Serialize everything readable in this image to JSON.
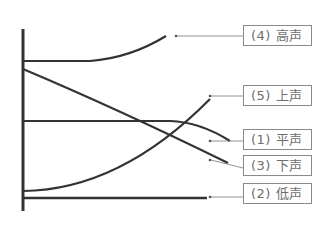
{
  "diagram": {
    "type": "tone-contour-diagram",
    "line_color": "#333333",
    "leader_color": "#777777",
    "labels": [
      {
        "id": "4",
        "text": "(4) 高声",
        "top": 25
      },
      {
        "id": "5",
        "text": "(5) 上声",
        "top": 85
      },
      {
        "id": "1",
        "text": "(1) 平声",
        "top": 129
      },
      {
        "id": "3",
        "text": "(3) 下声",
        "top": 155
      },
      {
        "id": "2",
        "text": "(2) 低声",
        "top": 183
      }
    ]
  }
}
